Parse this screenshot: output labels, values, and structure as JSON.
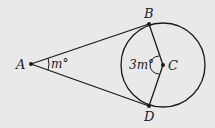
{
  "diagram": {
    "points": {
      "A": {
        "label": "A"
      },
      "B": {
        "label": "B"
      },
      "C": {
        "label": "C"
      },
      "D": {
        "label": "D"
      }
    },
    "angles": {
      "at_A": "m°",
      "at_C": "3m°"
    },
    "colors": {
      "background": "#e9e9e9",
      "stroke": "#1a1a1a"
    }
  }
}
